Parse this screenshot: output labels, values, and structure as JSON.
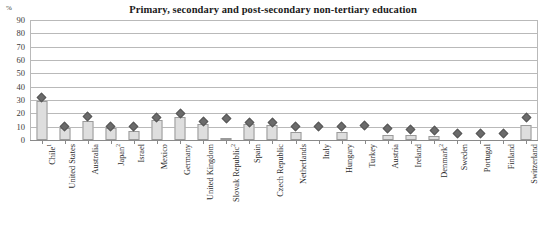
{
  "chart_data": {
    "type": "bar",
    "title": "Primary, secondary and post-secondary non-tertiary education",
    "xlabel": "",
    "ylabel": "%",
    "ylim": [
      0,
      90
    ],
    "ytick_step": 10,
    "yticks": [
      "0",
      "10",
      "20",
      "30",
      "40",
      "50",
      "60",
      "70",
      "80",
      "90"
    ],
    "grid": true,
    "legend_position": "none",
    "categories": [
      "Chile",
      "United States",
      "Australia",
      "Japan",
      "Israel",
      "Mexico",
      "Germany",
      "United Kingdom",
      "Slovak Republic",
      "Spain",
      "Czech Republic",
      "Netherlands",
      "Italy",
      "Hungary",
      "Turkey",
      "Austria",
      "Ireland",
      "Denmark",
      "Sweden",
      "Portugal",
      "Finland",
      "Switzerland"
    ],
    "category_footnotes": [
      "1",
      "",
      "",
      "2",
      "",
      "",
      "",
      "",
      "2",
      "",
      "",
      "",
      "",
      "",
      "",
      "",
      "",
      "2",
      "",
      "",
      "",
      ""
    ],
    "series": [
      {
        "name": "Bar series",
        "type": "bar",
        "values": [
          29,
          9,
          14,
          9,
          7,
          15,
          17,
          12,
          1,
          12,
          11,
          6,
          0,
          6,
          0,
          4,
          4,
          3,
          0,
          0,
          0,
          11
        ]
      },
      {
        "name": "Marker series",
        "type": "scatter",
        "values": [
          32,
          10,
          18,
          10,
          10,
          17,
          20,
          14,
          16,
          13,
          13,
          10,
          10,
          10,
          11,
          9,
          8,
          7,
          5,
          5,
          5,
          17
        ]
      }
    ],
    "colors": {
      "bar_fill": "#dedede",
      "bar_border": "#9a9a9a",
      "marker": "#6b6b6b",
      "gridline": "#b9b9b9",
      "text": "#2b2b2b"
    }
  }
}
